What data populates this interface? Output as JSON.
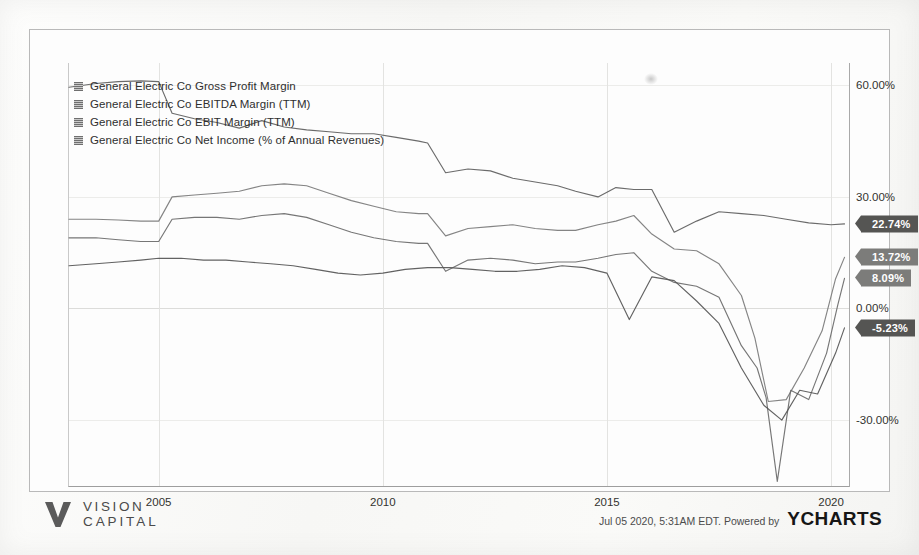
{
  "legend": {
    "items": [
      {
        "label": "General Electric Co Gross Profit Margin",
        "key": "gross_profit_margin"
      },
      {
        "label": "General Electric Co EBITDA Margin (TTM)",
        "key": "ebitda_margin"
      },
      {
        "label": "General Electric Co EBIT Margin (TTM)",
        "key": "ebit_margin"
      },
      {
        "label": "General Electric Co Net Income (% of Annual Revenues)",
        "key": "net_income_pct"
      }
    ]
  },
  "value_flags": [
    {
      "name": "gross-profit-margin-value",
      "value": "22.74%",
      "style": "dark"
    },
    {
      "name": "ebitda-margin-value",
      "value": "13.72%",
      "style": "light"
    },
    {
      "name": "ebit-margin-value",
      "value": "8.09%",
      "style": "light"
    },
    {
      "name": "net-income-value",
      "value": "-5.23%",
      "style": "dark"
    }
  ],
  "footer": {
    "logo_line1": "VISION",
    "logo_line2": "CAPITAL",
    "credit_date": "Jul 05 2020, 5:31AM EDT.  Powered by",
    "credit_brand": "YCHARTS"
  },
  "chart_data": {
    "type": "line",
    "title": "",
    "xlabel": "",
    "ylabel": "",
    "grid": true,
    "legend_position": "top-left",
    "xlim": [
      2003.0,
      2020.4
    ],
    "ylim": [
      -48.0,
      66.0
    ],
    "xticks": [
      "2005",
      "2010",
      "2015",
      "2020"
    ],
    "xtick_values": [
      2005,
      2010,
      2015,
      2020
    ],
    "yticks": [
      "60.00%",
      "30.00%",
      "0.00%",
      "-30.00%"
    ],
    "ytick_values": [
      60,
      30,
      0,
      -30
    ],
    "series": [
      {
        "name": "General Electric Co Gross Profit Margin",
        "color": "#5e5e5e",
        "last_value": 22.74,
        "x": [
          2003.0,
          2003.6,
          2004.1,
          2004.6,
          2005.0,
          2005.3,
          2005.8,
          2006.3,
          2006.8,
          2007.3,
          2007.8,
          2008.3,
          2008.8,
          2009.3,
          2009.8,
          2010.3,
          2010.8,
          2011.0,
          2011.4,
          2011.9,
          2012.4,
          2012.9,
          2013.4,
          2013.9,
          2014.3,
          2014.8,
          2015.2,
          2015.6,
          2016.0,
          2016.5,
          2017.0,
          2017.5,
          2018.0,
          2018.5,
          2019.0,
          2019.5,
          2020.0,
          2020.3
        ],
        "y": [
          59.5,
          60.5,
          61.0,
          61.2,
          61.0,
          52.5,
          51.0,
          50.0,
          48.5,
          50.5,
          48.8,
          48.0,
          47.5,
          47.0,
          47.0,
          46.0,
          45.0,
          44.5,
          36.5,
          37.5,
          37.0,
          35.0,
          34.0,
          33.0,
          31.5,
          30.0,
          32.5,
          32.0,
          32.0,
          20.5,
          23.5,
          26.0,
          25.5,
          25.0,
          24.0,
          23.0,
          22.5,
          22.74
        ]
      },
      {
        "name": "General Electric Co EBITDA Margin (TTM)",
        "color": "#7a7a7a",
        "last_value": 13.72,
        "x": [
          2003.0,
          2003.6,
          2004.1,
          2004.6,
          2005.0,
          2005.3,
          2005.8,
          2006.3,
          2006.8,
          2007.3,
          2007.8,
          2008.3,
          2008.8,
          2009.3,
          2009.8,
          2010.3,
          2010.8,
          2011.0,
          2011.4,
          2011.9,
          2012.4,
          2012.9,
          2013.4,
          2013.9,
          2014.3,
          2014.8,
          2015.2,
          2015.6,
          2016.0,
          2016.5,
          2017.0,
          2017.5,
          2018.0,
          2018.3,
          2018.6,
          2019.0,
          2019.4,
          2019.8,
          2020.1,
          2020.3
        ],
        "y": [
          24.0,
          24.0,
          23.8,
          23.5,
          23.5,
          30.0,
          30.5,
          31.0,
          31.5,
          33.0,
          33.5,
          33.0,
          31.0,
          29.0,
          27.5,
          26.0,
          25.5,
          25.5,
          19.5,
          21.5,
          22.0,
          22.5,
          21.5,
          21.0,
          21.0,
          22.5,
          23.5,
          25.0,
          20.0,
          16.0,
          15.5,
          12.0,
          3.5,
          -8.0,
          -25.0,
          -24.5,
          -16.0,
          -6.0,
          8.0,
          13.72
        ]
      },
      {
        "name": "General Electric Co EBIT Margin (TTM)",
        "color": "#6a6a6a",
        "last_value": 8.09,
        "x": [
          2003.0,
          2003.6,
          2004.1,
          2004.6,
          2005.0,
          2005.3,
          2005.8,
          2006.3,
          2006.8,
          2007.3,
          2007.8,
          2008.3,
          2008.8,
          2009.3,
          2009.8,
          2010.3,
          2010.8,
          2011.0,
          2011.4,
          2011.9,
          2012.4,
          2012.9,
          2013.4,
          2013.9,
          2014.3,
          2014.8,
          2015.2,
          2015.6,
          2016.0,
          2016.5,
          2017.0,
          2017.5,
          2018.0,
          2018.35,
          2018.55,
          2018.8,
          2019.1,
          2019.5,
          2019.9,
          2020.15,
          2020.3
        ],
        "y": [
          19.0,
          19.0,
          18.5,
          18.0,
          18.0,
          24.0,
          24.5,
          24.5,
          24.0,
          25.0,
          25.5,
          24.5,
          22.5,
          20.5,
          19.0,
          18.0,
          17.5,
          17.5,
          10.0,
          13.0,
          13.5,
          13.0,
          12.0,
          12.5,
          12.5,
          13.5,
          14.5,
          15.0,
          10.0,
          7.0,
          6.0,
          3.0,
          -10.0,
          -16.0,
          -24.0,
          -46.5,
          -22.0,
          -24.5,
          -12.0,
          1.0,
          8.09
        ]
      },
      {
        "name": "General Electric Co Net Income (% of Annual Revenues)",
        "color": "#555555",
        "last_value": -5.23,
        "x": [
          2003.0,
          2003.6,
          2004.1,
          2004.6,
          2005.0,
          2005.5,
          2006.0,
          2006.5,
          2007.0,
          2007.5,
          2008.0,
          2008.5,
          2009.0,
          2009.5,
          2010.0,
          2010.5,
          2011.0,
          2011.5,
          2012.0,
          2012.5,
          2013.0,
          2013.5,
          2014.0,
          2014.5,
          2015.0,
          2015.5,
          2016.0,
          2016.5,
          2017.0,
          2017.5,
          2018.0,
          2018.5,
          2018.9,
          2019.3,
          2019.7,
          2020.1,
          2020.3
        ],
        "y": [
          11.5,
          12.0,
          12.5,
          13.0,
          13.5,
          13.5,
          13.0,
          13.0,
          12.5,
          12.0,
          11.5,
          10.5,
          9.5,
          9.0,
          9.5,
          10.5,
          11.0,
          11.0,
          10.5,
          10.0,
          10.0,
          10.5,
          11.5,
          11.0,
          9.5,
          -3.0,
          8.5,
          7.5,
          2.0,
          -4.0,
          -16.0,
          -26.0,
          -30.0,
          -22.0,
          -23.0,
          -12.0,
          -5.23
        ]
      }
    ]
  }
}
